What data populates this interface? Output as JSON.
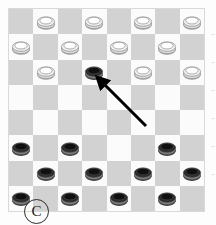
{
  "figure": {
    "panel_label": "C",
    "caption_label_shape": "circled-letter",
    "width": 216,
    "height": 225
  },
  "board": {
    "name": "checkers-board",
    "rows": 8,
    "cols": 8,
    "light_square_color": "#fbfbfb",
    "dark_square_color": "#d2d2d2",
    "border_color": "#d9d9d9",
    "dark_square_rule": "row_plus_col_even"
  },
  "pieces": {
    "white_label": "white-piece",
    "black_label": "black-piece",
    "white_fill": "#ffffff",
    "white_stroke": "#8a8a8a",
    "black_fill": "#101010",
    "black_stroke": "#4a4a4a",
    "placements": [
      {
        "row": 0,
        "col": 1,
        "color": "white"
      },
      {
        "row": 0,
        "col": 3,
        "color": "white"
      },
      {
        "row": 0,
        "col": 5,
        "color": "white"
      },
      {
        "row": 0,
        "col": 7,
        "color": "white"
      },
      {
        "row": 1,
        "col": 0,
        "color": "white"
      },
      {
        "row": 1,
        "col": 2,
        "color": "white"
      },
      {
        "row": 1,
        "col": 4,
        "color": "white"
      },
      {
        "row": 1,
        "col": 6,
        "color": "white"
      },
      {
        "row": 2,
        "col": 1,
        "color": "white"
      },
      {
        "row": 2,
        "col": 3,
        "color": "black"
      },
      {
        "row": 2,
        "col": 5,
        "color": "white"
      },
      {
        "row": 2,
        "col": 7,
        "color": "white"
      },
      {
        "row": 5,
        "col": 0,
        "color": "black"
      },
      {
        "row": 5,
        "col": 2,
        "color": "black"
      },
      {
        "row": 5,
        "col": 6,
        "color": "black"
      },
      {
        "row": 6,
        "col": 1,
        "color": "black"
      },
      {
        "row": 6,
        "col": 3,
        "color": "black"
      },
      {
        "row": 6,
        "col": 5,
        "color": "black"
      },
      {
        "row": 6,
        "col": 7,
        "color": "black"
      },
      {
        "row": 7,
        "col": 0,
        "color": "black"
      },
      {
        "row": 7,
        "col": 2,
        "color": "black"
      },
      {
        "row": 7,
        "col": 4,
        "color": "black"
      },
      {
        "row": 7,
        "col": 6,
        "color": "black"
      }
    ]
  },
  "annotation": {
    "arrow": {
      "name": "pointer-arrow",
      "color": "#000000",
      "from_x": 146,
      "from_y": 126,
      "to_x": 94,
      "to_y": 74,
      "target_description": "black piece at row 2 column 3"
    }
  }
}
